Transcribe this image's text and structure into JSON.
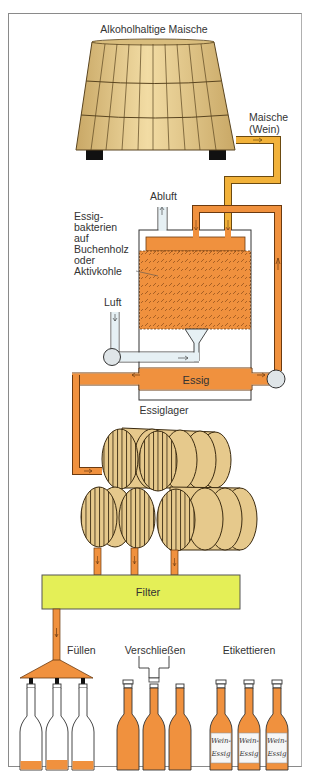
{
  "diagram": {
    "title": "Alkoholhaltige Maische",
    "labels": {
      "maische_line1": "Maische",
      "maische_line2": "(Wein)",
      "abluft": "Abluft",
      "bacteria": [
        "Essig-",
        "bakterien",
        "auf",
        "Buchenholz",
        "oder",
        "Aktivkohle"
      ],
      "luft": "Luft",
      "essig": "Essig",
      "essiglager": "Essiglager",
      "filter": "Filter",
      "fuellen": "Füllen",
      "verschliessen": "Verschließen",
      "etikettieren": "Etikettieren",
      "label_line1": "Wein-",
      "label_line2": "Essig"
    },
    "colors": {
      "vat": "#e8c98a",
      "vat_lines": "#5a4520",
      "wine_pipe": "#f2b23a",
      "vinegar": "#f0913e",
      "air_pipe": "#e6f0f4",
      "filter": "#e4ef57",
      "stroke": "#333333"
    },
    "stages": [
      "Maische",
      "Essigbildner",
      "Essiglager",
      "Filter",
      "Füllen",
      "Verschließen",
      "Etikettieren"
    ]
  }
}
